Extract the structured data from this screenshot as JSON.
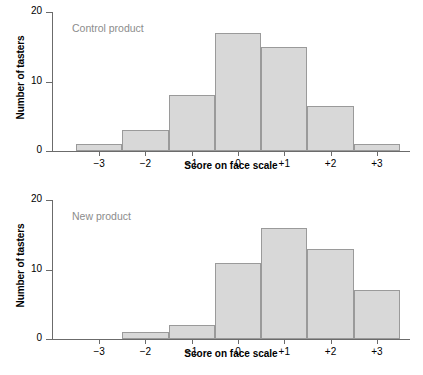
{
  "chart_data": [
    {
      "type": "bar",
      "title": "Control product",
      "xlabel": "Score on face scale",
      "ylabel": "Number of tasters",
      "categories": [
        "−3",
        "−2",
        "−1",
        "0",
        "+1",
        "+2",
        "+3"
      ],
      "values": [
        1,
        3,
        8,
        17,
        15,
        6.5,
        1
      ],
      "ylim": [
        0,
        20
      ],
      "yticks": [
        0,
        10,
        20
      ],
      "ytick_labels": [
        "0",
        "10",
        "20"
      ],
      "grid": false,
      "legend": "none"
    },
    {
      "type": "bar",
      "title": "New product",
      "xlabel": "Score on face scale",
      "ylabel": "Number of tasters",
      "categories": [
        "−3",
        "−2",
        "−1",
        "0",
        "+1",
        "+2",
        "+3"
      ],
      "values": [
        0,
        1,
        2,
        11,
        16,
        13,
        7
      ],
      "ylim": [
        0,
        20
      ],
      "yticks": [
        0,
        10,
        20
      ],
      "ytick_labels": [
        "0",
        "10",
        "20"
      ],
      "grid": false,
      "legend": "none"
    }
  ],
  "style": {
    "bar_fill": "#d8d8d8",
    "bar_stroke": "#9a9a9a",
    "axis_color": "#6b6b6b",
    "title_color": "#8c8c8c",
    "text_color": "#000000"
  }
}
